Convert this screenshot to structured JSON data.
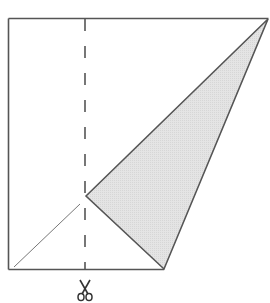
{
  "diagram": {
    "type": "paper-folding-cut",
    "colors": {
      "line": "#555555",
      "thin_line": "#777777",
      "fill": "#e2e2e2",
      "background": "#ffffff"
    },
    "square": {
      "top_left": [
        8.5,
        18.5
      ],
      "top_right": [
        268.5,
        18.5
      ],
      "bottom_left": [
        8.5,
        269.5
      ],
      "bottom_line_end": [
        164,
        269.5
      ]
    },
    "shaded_triangle": {
      "points": [
        [
          86,
          196
        ],
        [
          268,
          19
        ],
        [
          164,
          269
        ]
      ]
    },
    "thin_diagonal": {
      "from": [
        14,
        267
      ],
      "to": [
        80,
        204
      ]
    },
    "cut_line": {
      "x": 85,
      "y_start": 19,
      "y_end": 269,
      "dash": "12 15"
    },
    "scissors_icon": {
      "glyph": "✂",
      "center": [
        85,
        292
      ]
    }
  }
}
